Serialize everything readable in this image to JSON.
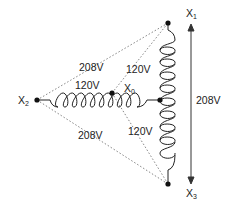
{
  "diagram": {
    "title": "",
    "type": "wye transformer secondary voltages",
    "nodes": {
      "x1": {
        "label": "X",
        "sub": "1"
      },
      "x2": {
        "label": "X",
        "sub": "2"
      },
      "x3": {
        "label": "X",
        "sub": "3"
      },
      "x0": {
        "label": "X",
        "sub": "0"
      }
    },
    "voltages": {
      "x2_x1": "208V",
      "x2_x3": "208V",
      "x1_x3": "208V",
      "x2_x0": "120V",
      "x0_x1": "120V",
      "x0_x3": "120V"
    },
    "colors": {
      "line": "#222222",
      "dotted": "#666666"
    }
  }
}
